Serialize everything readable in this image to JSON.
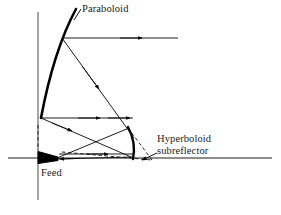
{
  "figure": {
    "type": "optics-ray-diagram",
    "background_color": "#ffffff",
    "ink_color": "#000000",
    "width": 281,
    "height": 215
  },
  "labels": {
    "paraboloid": "Paraboloid",
    "hyperboloid_line1": "Hyperboloid",
    "hyperboloid_line2": "subreflector",
    "feed": "Feed"
  },
  "geometry": {
    "axis": {
      "name": "optical-axis",
      "x1": 8,
      "y1": 158,
      "x2": 272,
      "y2": 158
    },
    "aperture_line": {
      "name": "aperture-plane",
      "x1": 38,
      "y1": 12,
      "x2": 38,
      "y2": 200
    },
    "paraboloid": {
      "name": "paraboloid-main-reflector",
      "path": "M 76 9 C 62 35, 50 70, 41 118",
      "stroke_width": 2.6
    },
    "hyperboloid": {
      "name": "hyperboloid-subreflector",
      "path": "M 128 127 C 134 138, 135 149, 133 159",
      "stroke_width": 2.4
    },
    "feed_horn": {
      "name": "feed-horn",
      "path": "M 39 152 L 57 157 L 57 160 L 39 163 Z"
    },
    "rays": [
      {
        "name": "ray-upper-outgoing",
        "x1": 62,
        "y1": 38,
        "x2": 178,
        "y2": 38,
        "arrow_at": 0.68
      },
      {
        "name": "ray-upper-diagonal",
        "x1": 62,
        "y1": 38,
        "x2": 133,
        "y2": 137,
        "arrow_at": 0.52
      },
      {
        "name": "ray-lower-outgoing",
        "x1": 41,
        "y1": 118,
        "x2": 133,
        "y2": 118,
        "arrow_at": 0.66
      },
      {
        "name": "ray-lower-outgoing-2",
        "x1": 41,
        "y1": 118,
        "x2": 133,
        "y2": 118,
        "arrow_at": 0.96
      },
      {
        "name": "ray-vertex-diagonal",
        "x1": 41,
        "y1": 118,
        "x2": 130,
        "y2": 156,
        "arrow_at": 0.36
      },
      {
        "name": "ray-feed-to-sub-up",
        "x1": 56,
        "y1": 158,
        "x2": 128,
        "y2": 128,
        "arrow_at": 0.46
      },
      {
        "name": "ray-sub-to-feed",
        "x1": 131,
        "y1": 156,
        "x2": 57,
        "y2": 159,
        "arrow_at": 0.82
      },
      {
        "name": "ray-feed-horizontal",
        "x1": 60,
        "y1": 155,
        "x2": 133,
        "y2": 155,
        "arrow_at": 0.62
      }
    ],
    "dashed_rays": [
      {
        "name": "dashed-virtual-focus-upper",
        "x1": 62,
        "y1": 152,
        "x2": 152,
        "y2": 160
      },
      {
        "name": "dashed-virtual-focus-lower",
        "x1": 128,
        "y1": 128,
        "x2": 152,
        "y2": 160
      },
      {
        "name": "dashed-axis-segment",
        "x1": 133,
        "y1": 158,
        "x2": 152,
        "y2": 160
      }
    ],
    "leaders": [
      {
        "name": "leader-paraboloid",
        "x1": 81,
        "y1": 10,
        "x2": 75,
        "y2": 20
      },
      {
        "name": "leader-hyperboloid",
        "x1": 156,
        "y1": 155,
        "x2": 140,
        "y2": 160
      }
    ]
  }
}
